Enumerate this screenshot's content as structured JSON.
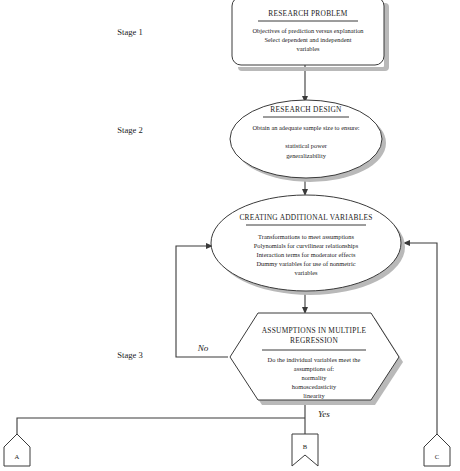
{
  "diagram": {
    "stages": [
      {
        "id": "stage-1",
        "label": "Stage 1"
      },
      {
        "id": "stage-2",
        "label": "Stage 2"
      },
      {
        "id": "stage-3",
        "label": "Stage 3"
      }
    ],
    "nodes": [
      {
        "id": "research-problem",
        "shape": "rounded-rectangle",
        "title": "RESEARCH PROBLEM",
        "lines": [
          "Objectives of prediction versus explanation",
          "Select dependent and independent",
          "variables"
        ]
      },
      {
        "id": "research-design",
        "shape": "ellipse",
        "title": "RESEARCH DESIGN",
        "lines": [
          "Obtain an adequate sample size to ensure:",
          "",
          "statistical power",
          "generalizability"
        ]
      },
      {
        "id": "creating-additional-variables",
        "shape": "ellipse",
        "title": "CREATING ADDITIONAL VARIABLES",
        "lines": [
          "Transformations to meet assumptions",
          "Polynomials for curvilinear relationships",
          "Interaction terms for moderator effects",
          "Dummy variables for use of nonmetric",
          "variables"
        ]
      },
      {
        "id": "assumptions-in-multiple-regression",
        "shape": "hexagon",
        "title_line_1": "ASSUMPTIONS IN MULTIPLE",
        "title_line_2": "REGRESSION",
        "lines": [
          "Do the individual variables meet the",
          "assumptions of:",
          "normality",
          "homoscedasticity",
          "linearity"
        ]
      }
    ],
    "branches": [
      {
        "id": "branch-no",
        "label": "No"
      },
      {
        "id": "branch-yes",
        "label": "Yes"
      }
    ],
    "connectors": [
      {
        "id": "connector-a",
        "label": "A"
      },
      {
        "id": "connector-b",
        "label": "B"
      },
      {
        "id": "connector-c",
        "label": "C"
      }
    ],
    "colors": {
      "stroke": "#3a3a3a",
      "shadow": "#b9b9b9",
      "text": "#1b1b1b",
      "background": "#ffffff"
    }
  }
}
